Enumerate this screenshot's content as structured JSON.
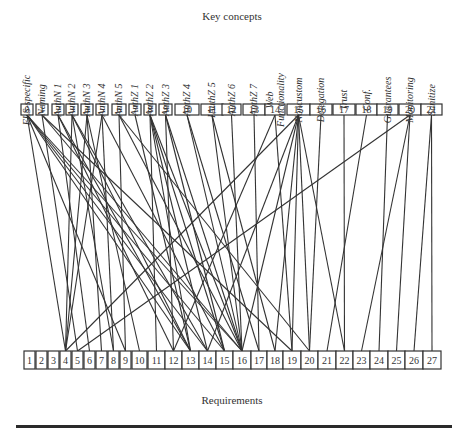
{
  "titles": {
    "top": "Key concepts",
    "bottom": "Requirements"
  },
  "concepts": [
    {
      "id": "0",
      "label": "ELS-specific",
      "x": 21,
      "w": 12
    },
    {
      "id": "1",
      "label": "Naming",
      "x": 36,
      "w": 12
    },
    {
      "id": "2",
      "label": "AuthN 1",
      "x": 52,
      "w": 12
    },
    {
      "id": "3",
      "label": "AuthN 2",
      "x": 66,
      "w": 12
    },
    {
      "id": "4",
      "label": "AuthN 3",
      "x": 81,
      "w": 12
    },
    {
      "id": "5",
      "label": "AuthN 4",
      "x": 96,
      "w": 12
    },
    {
      "id": "6",
      "label": "AuthN 5",
      "x": 112,
      "w": 14
    },
    {
      "id": "7",
      "label": "AuthZ 1",
      "x": 129,
      "w": 12
    },
    {
      "id": "8",
      "label": "AuthZ 2",
      "x": 144,
      "w": 12
    },
    {
      "id": "9",
      "label": "AuthZ 3",
      "x": 159,
      "w": 13
    },
    {
      "id": "10",
      "label": "AuthZ 4",
      "x": 175,
      "w": 24
    },
    {
      "id": "11",
      "label": "IAuthZ 5",
      "x": 201,
      "w": 22
    },
    {
      "id": "12",
      "label": "AuthZ 6",
      "x": 222,
      "w": 19
    },
    {
      "id": "13",
      "label": "AuthZ 7",
      "x": 243,
      "w": 22
    },
    {
      "id": "14",
      "label": "Web Functionality",
      "x": 265,
      "w": 20
    },
    {
      "id": "15",
      "label": "Noncustom",
      "x": 287,
      "w": 23
    },
    {
      "id": "16",
      "label": "Delegation",
      "x": 310,
      "w": 22
    },
    {
      "id": "17",
      "label": "Trust",
      "x": 333,
      "w": 22
    },
    {
      "id": "18",
      "label": "Conf.",
      "x": 356,
      "w": 21
    },
    {
      "id": "19",
      "label": "Guarantees",
      "x": 377,
      "w": 21
    },
    {
      "id": "20",
      "label": "Monitoring",
      "x": 399,
      "w": 22
    },
    {
      "id": "21",
      "label": "Sanitize",
      "x": 421,
      "w": 21
    }
  ],
  "requirements": [
    {
      "id": "1",
      "x": 24,
      "w": 11
    },
    {
      "id": "2",
      "x": 36,
      "w": 11
    },
    {
      "id": "3",
      "x": 48,
      "w": 11
    },
    {
      "id": "4",
      "x": 60,
      "w": 11
    },
    {
      "id": "5",
      "x": 72,
      "w": 11
    },
    {
      "id": "6",
      "x": 84,
      "w": 11
    },
    {
      "id": "7",
      "x": 96,
      "w": 11
    },
    {
      "id": "8",
      "x": 108,
      "w": 11
    },
    {
      "id": "9",
      "x": 120,
      "w": 11
    },
    {
      "id": "10",
      "x": 132,
      "w": 15
    },
    {
      "id": "11",
      "x": 148,
      "w": 17
    },
    {
      "id": "12",
      "x": 165,
      "w": 17
    },
    {
      "id": "13",
      "x": 182,
      "w": 17
    },
    {
      "id": "14",
      "x": 199,
      "w": 17
    },
    {
      "id": "15",
      "x": 216,
      "w": 17
    },
    {
      "id": "16",
      "x": 233,
      "w": 18
    },
    {
      "id": "17",
      "x": 251,
      "w": 16
    },
    {
      "id": "18",
      "x": 267,
      "w": 16
    },
    {
      "id": "19",
      "x": 283,
      "w": 18
    },
    {
      "id": "20",
      "x": 301,
      "w": 17
    },
    {
      "id": "21",
      "x": 318,
      "w": 18
    },
    {
      "id": "22",
      "x": 336,
      "w": 17
    },
    {
      "id": "23",
      "x": 353,
      "w": 17
    },
    {
      "id": "24",
      "x": 370,
      "w": 18
    },
    {
      "id": "25",
      "x": 388,
      "w": 17
    },
    {
      "id": "26",
      "x": 405,
      "w": 18
    },
    {
      "id": "27",
      "x": 423,
      "w": 18
    }
  ],
  "edges": [
    [
      "0",
      "4"
    ],
    [
      "0",
      "9"
    ],
    [
      "0",
      "13"
    ],
    [
      "0",
      "14"
    ],
    [
      "0",
      "15"
    ],
    [
      "0",
      "16"
    ],
    [
      "1",
      "5"
    ],
    [
      "1",
      "16"
    ],
    [
      "1",
      "19"
    ],
    [
      "2",
      "6"
    ],
    [
      "2",
      "12"
    ],
    [
      "2",
      "13"
    ],
    [
      "3",
      "4"
    ],
    [
      "3",
      "8"
    ],
    [
      "3",
      "13"
    ],
    [
      "3",
      "14"
    ],
    [
      "4",
      "4"
    ],
    [
      "4",
      "7"
    ],
    [
      "4",
      "10"
    ],
    [
      "5",
      "4"
    ],
    [
      "5",
      "8"
    ],
    [
      "5",
      "15"
    ],
    [
      "6",
      "9"
    ],
    [
      "6",
      "16"
    ],
    [
      "6",
      "20"
    ],
    [
      "7",
      "13"
    ],
    [
      "8",
      "11"
    ],
    [
      "8",
      "13"
    ],
    [
      "8",
      "14"
    ],
    [
      "8",
      "15"
    ],
    [
      "8",
      "16"
    ],
    [
      "9",
      "12"
    ],
    [
      "9",
      "15"
    ],
    [
      "9",
      "16"
    ],
    [
      "10",
      "16"
    ],
    [
      "10",
      "17"
    ],
    [
      "11",
      "16"
    ],
    [
      "11",
      "18"
    ],
    [
      "12",
      "16"
    ],
    [
      "13",
      "17"
    ],
    [
      "14",
      "12"
    ],
    [
      "14",
      "19"
    ],
    [
      "15",
      "4"
    ],
    [
      "15",
      "14"
    ],
    [
      "15",
      "16"
    ],
    [
      "15",
      "18"
    ],
    [
      "15",
      "19"
    ],
    [
      "15",
      "20"
    ],
    [
      "15",
      "22"
    ],
    [
      "16",
      "20"
    ],
    [
      "17",
      "22"
    ],
    [
      "18",
      "21"
    ],
    [
      "19",
      "24"
    ],
    [
      "20",
      "5"
    ],
    [
      "20",
      "23"
    ],
    [
      "20",
      "25"
    ],
    [
      "21",
      "26"
    ],
    [
      "21",
      "27"
    ]
  ]
}
